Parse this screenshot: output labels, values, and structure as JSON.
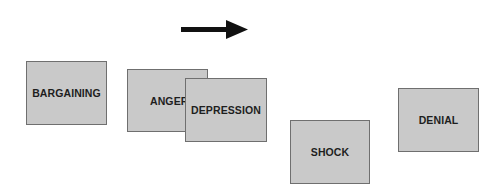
{
  "diagram": {
    "direction_arrow": {
      "icon": "arrow-right-icon",
      "color": "#111111"
    },
    "cards": [
      {
        "id": "bargaining",
        "label": "BARGAINING",
        "x": 26,
        "y": 61,
        "w": 81,
        "h": 64
      },
      {
        "id": "anger",
        "label": "ANGER",
        "x": 127,
        "y": 69,
        "w": 81,
        "h": 63
      },
      {
        "id": "depression",
        "label": "DEPRESSION",
        "x": 185,
        "y": 78,
        "w": 82,
        "h": 64
      },
      {
        "id": "shock",
        "label": "SHOCK",
        "x": 290,
        "y": 120,
        "w": 80,
        "h": 64
      },
      {
        "id": "denial",
        "label": "DENIAL",
        "x": 398,
        "y": 88,
        "w": 81,
        "h": 64
      }
    ],
    "card_fill": "#c9c9c9",
    "card_border": "#6f6f6f"
  }
}
